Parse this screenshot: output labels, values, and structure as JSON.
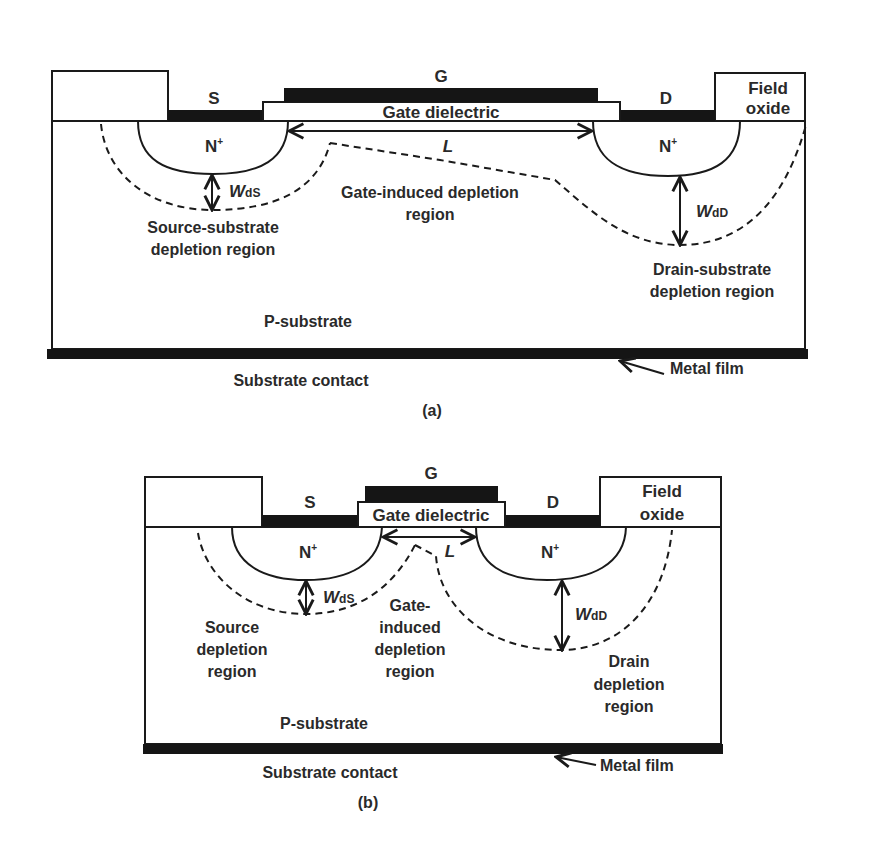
{
  "figure_a": {
    "caption": "(a)",
    "gate_label": "G",
    "source_label": "S",
    "drain_label": "D",
    "gate_dielectric_label": "Gate dielectric",
    "field_oxide_label_line1": "Field",
    "field_oxide_label_line2": "oxide",
    "source_region_label": "N",
    "drain_region_label": "N",
    "doping_sup": "+",
    "channel_length_label": "L",
    "wds_main": "W",
    "wds_sub": "dS",
    "wdd_main": "W",
    "wdd_sub": "dD",
    "gate_depletion_line1": "Gate-induced depletion",
    "gate_depletion_line2": "region",
    "source_depletion_line1": "Source-substrate",
    "source_depletion_line2": "depletion region",
    "drain_depletion_line1": "Drain-substrate",
    "drain_depletion_line2": "depletion region",
    "substrate_label": "P-substrate",
    "metal_film_label": "Metal film",
    "substrate_contact_label": "Substrate contact"
  },
  "figure_b": {
    "caption": "(b)",
    "gate_label": "G",
    "source_label": "S",
    "drain_label": "D",
    "gate_dielectric_label": "Gate dielectric",
    "field_oxide_label_line1": "Field",
    "field_oxide_label_line2": "oxide",
    "source_region_label": "N",
    "drain_region_label": "N",
    "doping_sup": "+",
    "channel_length_label": "L",
    "wds_main": "W",
    "wds_sub": "dS",
    "wdd_main": "W",
    "wdd_sub": "dD",
    "gate_depletion_line1": "Gate-",
    "gate_depletion_line2": "induced",
    "gate_depletion_line3": "depletion",
    "gate_depletion_line4": "region",
    "source_depletion_line1": "Source",
    "source_depletion_line2": "depletion",
    "source_depletion_line3": "region",
    "drain_depletion_line1": "Drain",
    "drain_depletion_line2": "depletion",
    "drain_depletion_line3": "region",
    "substrate_label": "P-substrate",
    "metal_film_label": "Metal film",
    "substrate_contact_label": "Substrate contact"
  }
}
